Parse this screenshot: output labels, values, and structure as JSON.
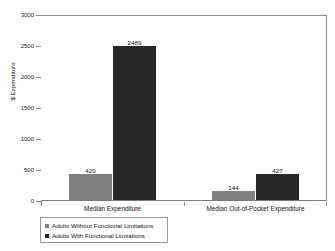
{
  "chart_data": {
    "type": "bar",
    "title": "",
    "subtitle": "",
    "xlabel": "",
    "ylabel": "$ Expenditure",
    "ylim": [
      0,
      3000
    ],
    "ytick_labels": [
      "0",
      "500",
      "1000",
      "1500",
      "2000",
      "2500",
      "3000"
    ],
    "ytick_values": [
      0,
      500,
      1000,
      1500,
      2000,
      2500,
      3000
    ],
    "grid": false,
    "legend_position": "bottom-left",
    "categories": [
      "Median Expenditure",
      "Median Out-of-Pocket Expenditure"
    ],
    "series": [
      {
        "name": "Adults Without Functional Limitations",
        "color": "#808080",
        "values": [
          420,
          144
        ],
        "value_labels": [
          "420",
          "144"
        ]
      },
      {
        "name": "Adults With Functional Limitations",
        "color": "#262626",
        "values": [
          2489,
          427
        ],
        "value_labels": [
          "2489",
          "427"
        ]
      }
    ]
  },
  "legend": {
    "items": [
      {
        "label": "Adults Without Functional Limitations",
        "swatch": "light"
      },
      {
        "label": "Adults With Functional Limitations",
        "swatch": "dark"
      }
    ]
  },
  "axis": {
    "y_title": "$ Expenditure",
    "ticks": [
      {
        "label": "3000"
      },
      {
        "label": "2500"
      },
      {
        "label": "2000"
      },
      {
        "label": "1500"
      },
      {
        "label": "1000"
      },
      {
        "label": "500"
      },
      {
        "label": "0"
      }
    ]
  },
  "bars": {
    "g1s1_label": "420",
    "g1s2_label": "2489",
    "g2s1_label": "144",
    "g2s2_label": "427"
  },
  "categories": {
    "cat1": "Median Expenditure",
    "cat2": "Median Out-of-Pocket Expenditure"
  }
}
